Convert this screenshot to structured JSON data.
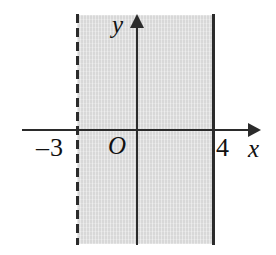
{
  "figure": {
    "axes": {
      "x_axis_label": "x",
      "y_axis_label": "y",
      "origin_label": "O"
    },
    "tick_labels": {
      "left_boundary": "–3",
      "right_boundary": "4"
    },
    "colors": {
      "shading": "#d8d8d8",
      "ink": "#2b2b2b",
      "background": "#ffffff"
    }
  },
  "chart_data": {
    "type": "area",
    "title": "",
    "xlabel": "x",
    "ylabel": "y",
    "grid": false,
    "legend": null,
    "xlim": [
      -5.4,
      5.4
    ],
    "ylim": [
      -3.4,
      3.4
    ],
    "origin_label": "O",
    "tick_labels": {
      "x": [
        "–3",
        "4"
      ],
      "y": []
    },
    "shaded_region": {
      "description": "Vertical strip between x = -3 and x = 4",
      "x_start": -3,
      "x_end": 4,
      "x_start_inclusive": false,
      "x_end_inclusive": true,
      "fill": "#d8d8d8",
      "extends_vertically": "full"
    },
    "boundaries": [
      {
        "name": "left-boundary",
        "equation": "x = -3",
        "value": -3,
        "style": "dashed",
        "inclusive": false,
        "label": "–3"
      },
      {
        "name": "right-boundary",
        "equation": "x = 4",
        "value": 4,
        "style": "solid",
        "inclusive": true,
        "label": "4"
      }
    ],
    "inequality": "-3 < x ≤ 4"
  }
}
